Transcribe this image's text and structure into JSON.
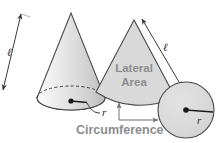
{
  "figure": {
    "background_color": "#ffffff",
    "shape_fill": "#d9d9d9",
    "shape_stroke": "#4a4a4a",
    "label_gray": "#8b8d8f",
    "label_dark": "#2b2b2b"
  },
  "cone": {
    "slant_label": "ℓ",
    "radius_label": "r",
    "apex": {
      "x": 71,
      "y": 13
    },
    "base_center": {
      "x": 71,
      "y": 98
    },
    "base_rx": 34,
    "base_ry": 12
  },
  "net": {
    "sector": {
      "area_label_line1": "Lateral",
      "area_label_line2": "Area",
      "slant_label": "ℓ",
      "apex": {
        "x": 134,
        "y": 20
      }
    },
    "base_circle": {
      "radius_label": "r",
      "center": {
        "x": 186,
        "y": 110
      },
      "radius": 28
    },
    "arc_label": "Circumference"
  }
}
